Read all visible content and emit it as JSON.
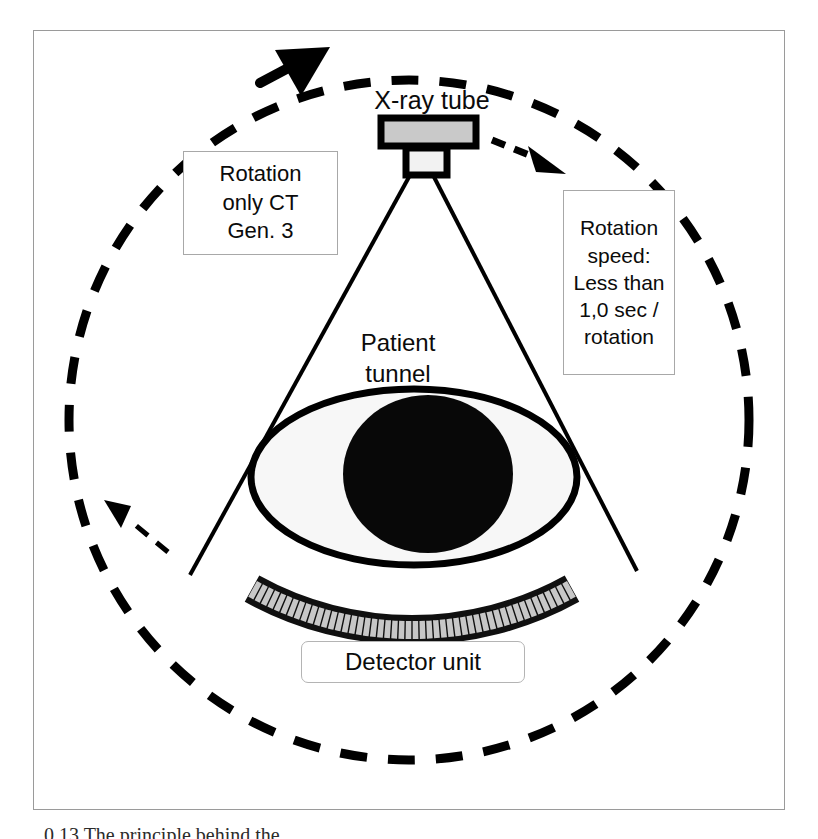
{
  "figure": {
    "caption": "0.13   The principle behind the",
    "frame_color": "#9a9a9a",
    "background": "#ffffff"
  },
  "labels": {
    "xray_tube": "X-ray tube",
    "patient_tunnel": "Patient\ntunnel",
    "detector_unit": "Detector unit"
  },
  "callouts": {
    "rotation_only": "Rotation\nonly CT\nGen. 3",
    "rotation_speed": "Rotation\nspeed:\nLess than\n1,0 sec /\nrotation"
  },
  "components": {
    "gantry_orbit": {
      "name": "dashed-rotation-circle",
      "style": "dashed",
      "stroke": "#000000",
      "stroke_width": 9,
      "dash": "26 20",
      "center_x": 409,
      "center_y": 420,
      "radius": 340
    },
    "xray_tube": {
      "housing_fill": "#c9c9c9",
      "window_fill": "#f2f2f2",
      "outline": "#000000"
    },
    "fan_beam": {
      "stroke": "#000000",
      "stroke_width": 4,
      "apex_x": 421,
      "apex_y": 178,
      "left_x": 190,
      "left_y": 572,
      "right_x": 636,
      "right_y": 572
    },
    "patient": {
      "body_fill": "#f7f7f7",
      "body_outline": "#000000",
      "organ_fill": "#080808",
      "center_x": 414,
      "center_y": 477,
      "rx": 163,
      "ry": 88
    },
    "detector": {
      "cell_fill": "#c7c7c7",
      "frame_fill": "#101010",
      "cell_count": 48,
      "arc_center_x": 412,
      "arc_center_y": 300,
      "arc_radius": 315
    },
    "arrows": {
      "top_arrow": {
        "name": "rotation-direction-arrow-top",
        "kind": "solid-triangle",
        "fill": "#000000",
        "x": 297,
        "y": 58
      },
      "left_arrow": {
        "name": "rotation-direction-arrow-left",
        "kind": "thin-arrow",
        "fill": "#000000",
        "x": 112,
        "y": 512
      },
      "tube_arrow": {
        "name": "tube-motion-arrow",
        "kind": "dashed-arrow",
        "fill": "#000000",
        "x": 545,
        "y": 162
      }
    }
  },
  "colors": {
    "ink": "#000000",
    "gray_fill": "#c9c9c9",
    "light_fill": "#f2f2f2",
    "frame_line": "#a8a8a8"
  }
}
